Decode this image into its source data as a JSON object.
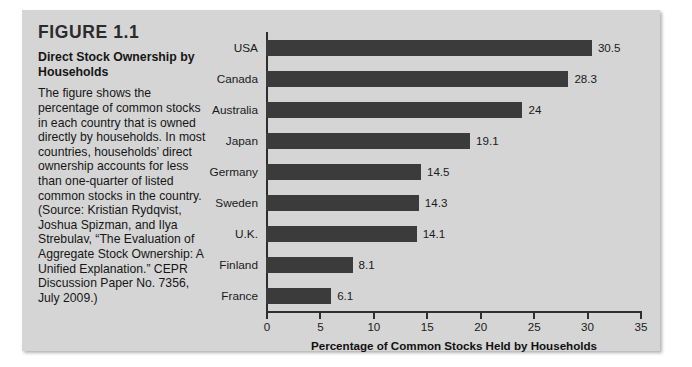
{
  "figure": {
    "number": "FIGURE 1.1",
    "subtitle": "Direct Stock Ownership by Households",
    "description": "The figure shows the percentage of common stocks in each country that is owned directly by households. In most countries, households’ direct ownership accounts for less than one-quarter of listed common stocks in the country. (Source: Kristian Rydqvist, Joshua Spizman, and Ilya Strebulav, “The Evaluation of Aggregate Stock Ownership: A Unified Explanation.” CEPR Discussion Paper No. 7356, July 2009.)"
  },
  "colors": {
    "panel_background": "#d5d5d5",
    "bar": "#3b3b3b",
    "axis": "#2e2e2e",
    "text": "#1a1a1a"
  },
  "chart_data": {
    "type": "bar",
    "orientation": "horizontal",
    "title": "Direct Stock Ownership by Households",
    "xlabel": "Percentage of Common Stocks Held by Households",
    "ylabel": "",
    "categories": [
      "USA",
      "Canada",
      "Australia",
      "Japan",
      "Germany",
      "Sweden",
      "U.K.",
      "Finland",
      "France"
    ],
    "values": [
      30.5,
      28.3,
      24,
      19.1,
      14.5,
      14.3,
      14.1,
      8.1,
      6.1
    ],
    "value_labels": [
      "30.5",
      "28.3",
      "24",
      "19.1",
      "14.5",
      "14.3",
      "14.1",
      "8.1",
      "6.1"
    ],
    "xlim": [
      0,
      35
    ],
    "xticks": [
      0,
      5,
      10,
      15,
      20,
      25,
      30,
      35
    ],
    "xtick_labels": [
      "0",
      "5",
      "10",
      "15",
      "20",
      "25",
      "30",
      "35"
    ],
    "grid": false,
    "legend": false
  }
}
